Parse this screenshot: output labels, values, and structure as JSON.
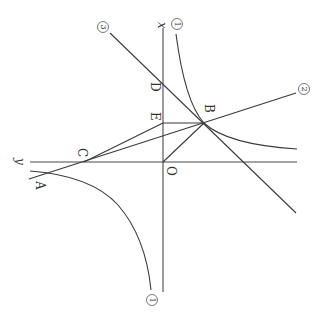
{
  "diagram": {
    "axes": {
      "x_label": "x",
      "y_label": "y",
      "origin_label": "O"
    },
    "points": {
      "A": "A",
      "B": "B",
      "C": "C",
      "D": "D",
      "E": "E"
    },
    "curve_labels": {
      "hyperbola_top": "1",
      "hyperbola_bottom": "1",
      "line_2": "2",
      "line_3": "3"
    },
    "colors": {
      "line": "#3a3a3a",
      "background": "#ffffff"
    }
  }
}
